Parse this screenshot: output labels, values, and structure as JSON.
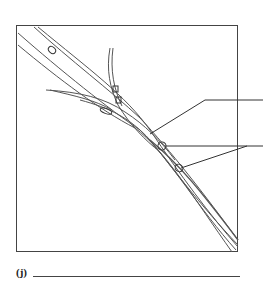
{
  "figure": {
    "frame": {
      "x": 16,
      "y": 25,
      "width": 222,
      "height": 227
    },
    "label_lines": [
      {
        "id": "label-1",
        "end_y": 100
      },
      {
        "id": "label-2",
        "end_y": 146
      }
    ],
    "stroke_color": "#555555"
  },
  "question": {
    "label": "(j)",
    "answer_value": ""
  }
}
